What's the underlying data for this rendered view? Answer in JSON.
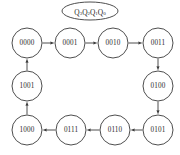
{
  "diagram": {
    "kind": "state-transition-diagram",
    "register_label": {
      "text": "Q3Q2Q1Q0",
      "bits": [
        {
          "name": "Q",
          "subscript": "3"
        },
        {
          "name": "Q",
          "subscript": "2"
        },
        {
          "name": "Q",
          "subscript": "1"
        },
        {
          "name": "Q",
          "subscript": "0"
        }
      ]
    },
    "colors": {
      "background": "#ffffff",
      "stroke": "#3a3a3a",
      "text": "#2b2b2b",
      "node_fill": "#ffffff"
    },
    "geometry": {
      "width": 180,
      "height": 155,
      "node_radius": 15,
      "ellipse_rx": 28,
      "ellipse_ry": 9,
      "ellipse_cx": 90,
      "ellipse_cy": 11
    },
    "nodes": [
      {
        "id": "s0",
        "label": "0000",
        "cx": 27,
        "cy": 43
      },
      {
        "id": "s1",
        "label": "0001",
        "cx": 70,
        "cy": 43
      },
      {
        "id": "s2",
        "label": "0010",
        "cx": 113,
        "cy": 43
      },
      {
        "id": "s3",
        "label": "0011",
        "cx": 158,
        "cy": 43
      },
      {
        "id": "s4",
        "label": "0100",
        "cx": 158,
        "cy": 86
      },
      {
        "id": "s5",
        "label": "0101",
        "cx": 158,
        "cy": 130
      },
      {
        "id": "s6",
        "label": "0110",
        "cx": 115,
        "cy": 130
      },
      {
        "id": "s7",
        "label": "0111",
        "cx": 71,
        "cy": 130
      },
      {
        "id": "s8",
        "label": "1000",
        "cx": 27,
        "cy": 130
      },
      {
        "id": "s9",
        "label": "1001",
        "cx": 27,
        "cy": 86
      }
    ],
    "edges": [
      {
        "from": "s0",
        "to": "s1",
        "direction": "right"
      },
      {
        "from": "s1",
        "to": "s2",
        "direction": "right"
      },
      {
        "from": "s2",
        "to": "s3",
        "direction": "right"
      },
      {
        "from": "s3",
        "to": "s4",
        "direction": "down"
      },
      {
        "from": "s4",
        "to": "s5",
        "direction": "down"
      },
      {
        "from": "s5",
        "to": "s6",
        "direction": "left"
      },
      {
        "from": "s6",
        "to": "s7",
        "direction": "left"
      },
      {
        "from": "s7",
        "to": "s8",
        "direction": "left"
      },
      {
        "from": "s8",
        "to": "s9",
        "direction": "up"
      },
      {
        "from": "s9",
        "to": "s0",
        "direction": "up"
      }
    ]
  }
}
